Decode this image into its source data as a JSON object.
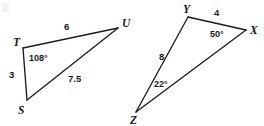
{
  "figure": {
    "background_color": "#ffffff",
    "stroke_color": "#1b1b1b",
    "text_color": "#17171a",
    "width": 264,
    "height": 126
  },
  "triangle_left": {
    "name": "triangle-STU",
    "vertices": [
      {
        "label": "T",
        "x": 23,
        "y": 48,
        "label_x": 13,
        "label_y": 46
      },
      {
        "label": "U",
        "x": 118,
        "y": 28,
        "label_x": 122,
        "label_y": 27
      },
      {
        "label": "S",
        "x": 27,
        "y": 100,
        "label_x": 18,
        "label_y": 114
      }
    ],
    "edges": [
      {
        "name": "edge-TU",
        "from": "T",
        "to": "U"
      },
      {
        "name": "edge-TS",
        "from": "T",
        "to": "S"
      },
      {
        "name": "edge-SU",
        "from": "S",
        "to": "U"
      }
    ],
    "side_labels": [
      {
        "name": "side-TU-length",
        "value": "6",
        "x": 64,
        "y": 30
      },
      {
        "name": "side-TS-length",
        "value": "3",
        "x": 9,
        "y": 78
      },
      {
        "name": "side-SU-length",
        "value": "7.5",
        "x": 68,
        "y": 82
      }
    ],
    "angle_labels": [
      {
        "name": "angle-T",
        "value": "108°",
        "x": 29,
        "y": 61
      }
    ]
  },
  "triangle_right": {
    "name": "triangle-XYZ",
    "vertices": [
      {
        "label": "Y",
        "x": 188,
        "y": 17,
        "label_x": 183,
        "label_y": 13
      },
      {
        "label": "X",
        "x": 246,
        "y": 30,
        "label_x": 250,
        "label_y": 34
      },
      {
        "label": "Z",
        "x": 136,
        "y": 112,
        "label_x": 130,
        "label_y": 124
      }
    ],
    "edges": [
      {
        "name": "edge-YX",
        "from": "Y",
        "to": "X"
      },
      {
        "name": "edge-YZ",
        "from": "Y",
        "to": "Z"
      },
      {
        "name": "edge-ZX",
        "from": "Z",
        "to": "X"
      }
    ],
    "side_labels": [
      {
        "name": "side-YX-length",
        "value": "4",
        "x": 214,
        "y": 16
      },
      {
        "name": "side-YZ-length",
        "value": "8",
        "x": 159,
        "y": 60
      }
    ],
    "angle_labels": [
      {
        "name": "angle-X",
        "value": "50°",
        "x": 210,
        "y": 37
      },
      {
        "name": "angle-Z",
        "value": "22°",
        "x": 154,
        "y": 87
      }
    ]
  }
}
